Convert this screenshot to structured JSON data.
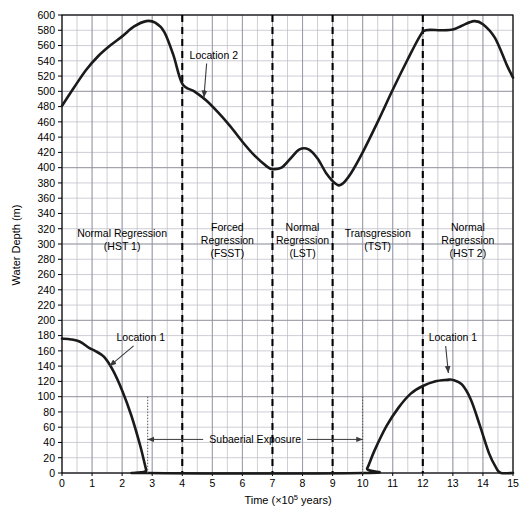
{
  "chart_data": {
    "type": "line",
    "title": "",
    "xlabel": "Time (×10⁵ years)",
    "ylabel": "Water Depth (m)",
    "xlim": [
      0,
      15
    ],
    "ylim": [
      0,
      600
    ],
    "grid": true,
    "legend_position": "none",
    "x_ticks": [
      0,
      1,
      2,
      3,
      4,
      5,
      6,
      7,
      8,
      9,
      10,
      11,
      12,
      13,
      14,
      15
    ],
    "x_tick_labels": [
      "0",
      "1",
      "2",
      "3",
      "4",
      "5",
      "6",
      "7",
      "8",
      "9",
      "10",
      "11",
      "12",
      "13",
      "14",
      "15"
    ],
    "y_ticks": [
      0,
      20,
      40,
      60,
      80,
      100,
      120,
      140,
      160,
      180,
      200,
      220,
      240,
      260,
      280,
      300,
      320,
      340,
      360,
      380,
      400,
      420,
      440,
      460,
      480,
      500,
      520,
      540,
      560,
      580,
      600
    ],
    "y_tick_labels": [
      "0",
      "20",
      "40",
      "60",
      "80",
      "100",
      "120",
      "140",
      "160",
      "180",
      "200",
      "220",
      "240",
      "260",
      "280",
      "300",
      "320",
      "340",
      "360",
      "380",
      "400",
      "420",
      "440",
      "460",
      "480",
      "500",
      "520",
      "540",
      "560",
      "580",
      "600"
    ],
    "x_minor_step": 0.5,
    "series": [
      {
        "name": "Location 2",
        "color": "#1a1a1a",
        "points": [
          [
            0.0,
            481
          ],
          [
            0.4,
            505
          ],
          [
            0.8,
            528
          ],
          [
            1.2,
            546
          ],
          [
            1.6,
            560
          ],
          [
            2.0,
            572
          ],
          [
            2.4,
            585
          ],
          [
            2.8,
            592
          ],
          [
            3.1,
            590
          ],
          [
            3.4,
            578
          ],
          [
            3.7,
            548
          ],
          [
            4.0,
            510
          ],
          [
            4.4,
            500
          ],
          [
            4.8,
            488
          ],
          [
            5.2,
            472
          ],
          [
            5.6,
            454
          ],
          [
            6.0,
            434
          ],
          [
            6.4,
            416
          ],
          [
            6.8,
            402
          ],
          [
            7.0,
            398
          ],
          [
            7.3,
            400
          ],
          [
            7.6,
            412
          ],
          [
            7.9,
            424
          ],
          [
            8.2,
            424
          ],
          [
            8.5,
            412
          ],
          [
            8.8,
            392
          ],
          [
            9.1,
            379
          ],
          [
            9.3,
            378
          ],
          [
            9.6,
            392
          ],
          [
            10.0,
            420
          ],
          [
            10.5,
            460
          ],
          [
            11.0,
            502
          ],
          [
            11.5,
            542
          ],
          [
            11.9,
            572
          ],
          [
            12.1,
            580
          ],
          [
            12.6,
            580
          ],
          [
            13.0,
            581
          ],
          [
            13.3,
            586
          ],
          [
            13.7,
            592
          ],
          [
            14.0,
            588
          ],
          [
            14.4,
            570
          ],
          [
            14.8,
            534
          ],
          [
            15.0,
            518
          ]
        ]
      },
      {
        "name": "Location 1",
        "color": "#1a1a1a",
        "points": [
          [
            0.0,
            176
          ],
          [
            0.3,
            175
          ],
          [
            0.6,
            172
          ],
          [
            0.9,
            164
          ],
          [
            1.1,
            160
          ],
          [
            1.4,
            152
          ],
          [
            1.7,
            134
          ],
          [
            2.0,
            108
          ],
          [
            2.3,
            76
          ],
          [
            2.6,
            36
          ],
          [
            2.8,
            4
          ],
          [
            2.85,
            0
          ],
          [
            10.0,
            0
          ],
          [
            10.15,
            6
          ],
          [
            10.4,
            30
          ],
          [
            10.8,
            62
          ],
          [
            11.2,
            86
          ],
          [
            11.6,
            104
          ],
          [
            12.0,
            114
          ],
          [
            12.4,
            120
          ],
          [
            12.8,
            122
          ],
          [
            13.0,
            122
          ],
          [
            13.3,
            116
          ],
          [
            13.6,
            96
          ],
          [
            13.9,
            62
          ],
          [
            14.2,
            26
          ],
          [
            14.45,
            6
          ],
          [
            14.6,
            0
          ],
          [
            15.0,
            0
          ]
        ]
      }
    ],
    "zone_dividers": [
      4,
      7,
      9,
      12
    ],
    "zones": [
      {
        "line1": "Normal Regression",
        "line2": "(HST 1)",
        "x_center": 2.0
      },
      {
        "line1": "Forced",
        "line2": "Regression",
        "line3": "(FSST)",
        "x_center": 5.5
      },
      {
        "line1": "Normal",
        "line2": "Regression",
        "line3": "(LST)",
        "x_center": 8.0
      },
      {
        "line1": "Transgression",
        "line2": "(TST)",
        "x_center": 10.5
      },
      {
        "line1": "Normal",
        "line2": "Regression",
        "line3": "(HST 2)",
        "x_center": 13.5
      }
    ],
    "annotations": [
      {
        "text": "Location 2",
        "label_x": 5.05,
        "label_y": 543,
        "tip_x": 4.72,
        "tip_y": 492
      },
      {
        "text": "Location 1",
        "label_x": 2.62,
        "label_y": 173,
        "tip_x": 1.58,
        "tip_y": 140
      },
      {
        "text": "Location 1",
        "label_x": 13.0,
        "label_y": 173,
        "tip_x": 12.85,
        "tip_y": 131
      }
    ],
    "span_annotation": {
      "text": "Subaerial Exposure",
      "x_start": 2.85,
      "x_end": 10.0,
      "y": 44,
      "drop_lines": [
        {
          "x": 2.85,
          "y_top": 100,
          "y_bottom": 0
        },
        {
          "x": 10.0,
          "y_top": 100,
          "y_bottom": 0
        }
      ]
    }
  },
  "axis": {
    "x_title_main": "Time (×10",
    "x_title_sup": "5",
    "x_title_tail": " years)",
    "y_title": "Water Depth (m)"
  },
  "colors": {
    "curve": "#1a1a1a",
    "grid_minor": "#b9b9c4",
    "grid_major": "#8d8d99",
    "axis": "#000000",
    "divider": "#000000",
    "annotation": "#3a3a3a",
    "background": "#ffffff"
  }
}
